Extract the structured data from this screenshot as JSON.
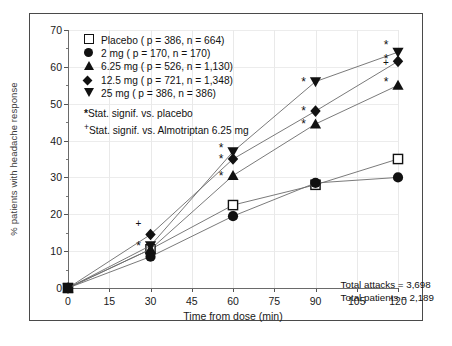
{
  "chart_data": {
    "type": "line",
    "title": "",
    "xlabel": "Time from dose (min)",
    "ylabel": "% patients with headache response",
    "x": [
      0,
      30,
      60,
      90,
      120
    ],
    "xlim": [
      0,
      120
    ],
    "ylim": [
      0,
      70
    ],
    "xticks": [
      "0",
      "15",
      "30",
      "45",
      "60",
      "75",
      "90",
      "105",
      "120"
    ],
    "yticks": [
      "0",
      "10",
      "20",
      "30",
      "40",
      "50",
      "60",
      "70"
    ],
    "grid": true,
    "legend_position": "upper-left",
    "series": [
      {
        "name": "Placebo ( p = 386, n = 664)",
        "label": "Placebo",
        "marker": "open-square",
        "p": "386",
        "n": "664",
        "values": [
          0,
          10.5,
          22.5,
          28.0,
          35.0
        ]
      },
      {
        "name": "2 mg ( p = 170, n = 170)",
        "label": "2 mg",
        "marker": "filled-circle",
        "p": "170",
        "n": "170",
        "values": [
          0,
          8.5,
          19.5,
          28.5,
          30.0
        ]
      },
      {
        "name": "6.25 mg ( p = 526, n = 1,130)",
        "label": "6.25 mg",
        "marker": "filled-triangle-up",
        "p": "526",
        "n": "1,130",
        "values": [
          0,
          10.5,
          30.5,
          44.5,
          55.0
        ]
      },
      {
        "name": "12.5 mg ( p = 721, n = 1,348)",
        "label": "12.5 mg",
        "marker": "filled-diamond",
        "p": "721",
        "n": "1,348",
        "values": [
          0,
          14.5,
          35.0,
          48.0,
          61.5
        ]
      },
      {
        "name": "25 mg ( p = 386, n = 386)",
        "label": "25 mg",
        "marker": "filled-triangle-down",
        "p": "386",
        "n": "386",
        "values": [
          0,
          11.5,
          37.0,
          56.0,
          64.0
        ]
      }
    ],
    "significance_markers": [
      {
        "symbol": "+",
        "x": 30,
        "y": 17.5
      },
      {
        "symbol": "*",
        "x": 30,
        "y": 11.5
      },
      {
        "symbol": "*",
        "x": 60,
        "y": 38.0
      },
      {
        "symbol": "*",
        "x": 60,
        "y": 35.0
      },
      {
        "symbol": "*",
        "x": 60,
        "y": 30.5
      },
      {
        "symbol": "*",
        "x": 90,
        "y": 56.0
      },
      {
        "symbol": "*",
        "x": 90,
        "y": 48.0
      },
      {
        "symbol": "*",
        "x": 90,
        "y": 44.5
      },
      {
        "symbol": "*",
        "x": 120,
        "y": 66.0
      },
      {
        "symbol": "*",
        "x": 120,
        "y": 62.0
      },
      {
        "symbol": "+",
        "x": 120,
        "y": 61.0
      },
      {
        "symbol": "*",
        "x": 120,
        "y": 56.0
      }
    ],
    "annotations": {
      "signif_placebo": "Stat. signif. vs. placebo",
      "signif_almotriptan": "Stat. signif. vs. Almotriptan 6.25 mg",
      "signif_placebo_symbol": "*",
      "signif_almotriptan_symbol": "+",
      "total_attacks": "Total attacks = 3,698",
      "total_patients": "Total patients = 2,189"
    },
    "colors": {
      "marker": "#111111",
      "line": "#6b6b6b",
      "frame": "#4a4a4a",
      "grid": "#ececec"
    }
  }
}
